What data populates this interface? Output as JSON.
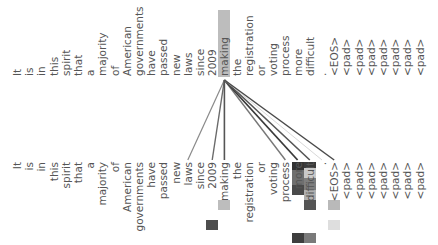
{
  "source_tokens": [
    "It",
    "is",
    "in",
    "this",
    "spirit",
    "that",
    "a",
    "majority",
    "of",
    "American",
    "governments",
    "have",
    "passed",
    "new",
    "laws",
    "since",
    "2009",
    "making",
    "the",
    "registration",
    "or",
    "voting",
    "process",
    "more",
    "difficult",
    ".",
    "<EOS>",
    "<pad>",
    "<pad>",
    "<pad>",
    "<pad>",
    "<pad>",
    "<pad>",
    "<pad>"
  ],
  "target_tokens": [
    "It",
    "is",
    "in",
    "this",
    "spirit",
    "that",
    "a",
    "majority",
    "of",
    "American",
    "governments",
    "have",
    "passed",
    "new",
    "laws",
    "since",
    "2009",
    "making",
    "the",
    "registration",
    "or",
    "voting",
    "process",
    "more",
    "difficult",
    ".",
    "<EOS>",
    "<pad>",
    "<pad>",
    "<pad>",
    "<pad>",
    "<pad>",
    "<pad>",
    "<pad>"
  ],
  "selected_token": {
    "index": 17,
    "label": "making"
  },
  "layout": {
    "col_x0": 17,
    "col_dx": 12.2,
    "line_origin_y": 80,
    "line_end_y": 160
  },
  "attention_lines": [
    {
      "to": 14,
      "color": "#8a8a8a",
      "width": 1.2
    },
    {
      "to": 16,
      "color": "#6a6a6a",
      "width": 1.4
    },
    {
      "to": 17,
      "color": "#555555",
      "width": 1.6
    },
    {
      "to": 22,
      "color": "#777777",
      "width": 1.4
    },
    {
      "to": 23,
      "color": "#3a3a3a",
      "width": 1.8
    },
    {
      "to": 24,
      "color": "#555555",
      "width": 1.6
    },
    {
      "to": 25,
      "color": "#d8d8d8",
      "width": 1.0
    },
    {
      "to": 26,
      "color": "#4a4a4a",
      "width": 1.5
    }
  ],
  "heat_cells": [
    {
      "col": 23,
      "y": 162,
      "h": 8,
      "color": "#333333"
    },
    {
      "col": 23,
      "y": 170,
      "h": 15,
      "color": "#6f6f6f"
    },
    {
      "col": 23,
      "y": 185,
      "h": 10,
      "color": "#4a4a4a"
    },
    {
      "col": 23,
      "y": 233,
      "h": 10,
      "color": "#3e3e3e"
    },
    {
      "col": 24,
      "y": 162,
      "h": 6,
      "color": "#3a3a3a"
    },
    {
      "col": 24,
      "y": 168,
      "h": 10,
      "color": "#c9c9c9"
    },
    {
      "col": 24,
      "y": 178,
      "h": 12,
      "color": "#7e7e7e"
    },
    {
      "col": 24,
      "y": 190,
      "h": 10,
      "color": "#b0b0b0"
    },
    {
      "col": 24,
      "y": 200,
      "h": 10,
      "color": "#555555"
    },
    {
      "col": 24,
      "y": 233,
      "h": 10,
      "color": "#7a7a7a"
    },
    {
      "col": 17,
      "y": 200,
      "h": 10,
      "color": "#bdbdbd"
    },
    {
      "col": 16,
      "y": 220,
      "h": 10,
      "color": "#4d4d4d"
    },
    {
      "col": 26,
      "y": 200,
      "h": 10,
      "color": "#b9b9b9"
    },
    {
      "col": 26,
      "y": 220,
      "h": 10,
      "color": "#dedede"
    }
  ]
}
